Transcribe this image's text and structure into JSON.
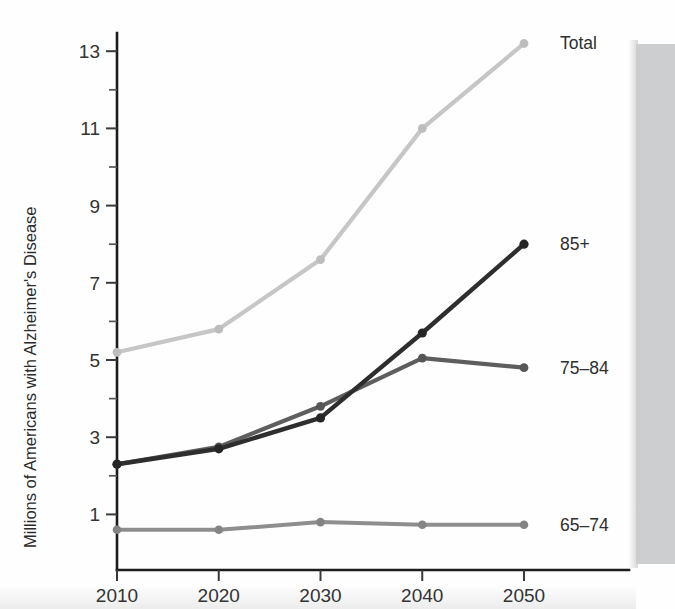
{
  "chart_data": {
    "type": "line",
    "title": "",
    "subtitle": "",
    "xlabel": "",
    "ylabel": "Millions of Americans with Alzheimer's Disease",
    "x": [
      2010,
      2020,
      2030,
      2040,
      2050
    ],
    "xtick_labels": [
      "2010",
      "2020",
      "2030",
      "2040",
      "2050"
    ],
    "ytick_labels": [
      "1",
      "3",
      "5",
      "7",
      "9",
      "11",
      "13"
    ],
    "ytick_values": [
      1,
      3,
      5,
      7,
      9,
      11,
      13
    ],
    "yminor_values": [
      2,
      4,
      6,
      8,
      10,
      12
    ],
    "ylim": [
      0.35,
      13.6
    ],
    "xlim": [
      2010,
      2050
    ],
    "grid": false,
    "legend_position": "right-inline",
    "series": [
      {
        "name": "Total",
        "label": "Total",
        "color": "#c6c6c6",
        "marker_color": "#bdbdbd",
        "stroke_width": 4.2,
        "marker_radius": 4.4,
        "values": [
          5.2,
          5.8,
          7.6,
          11.0,
          13.2
        ]
      },
      {
        "name": "85+",
        "label": "85+",
        "color": "#2e2e2e",
        "marker_color": "#262626",
        "stroke_width": 4.4,
        "marker_radius": 4.6,
        "values": [
          2.3,
          2.7,
          3.5,
          5.7,
          8.0
        ]
      },
      {
        "name": "75-84",
        "label": "75–84",
        "color": "#5e5e5e",
        "marker_color": "#565656",
        "stroke_width": 4.2,
        "marker_radius": 4.4,
        "values": [
          2.3,
          2.75,
          3.8,
          5.05,
          4.8
        ]
      },
      {
        "name": "65-74",
        "label": "65–74",
        "color": "#8e8e8e",
        "marker_color": "#848484",
        "stroke_width": 4.0,
        "marker_radius": 4.3,
        "values": [
          0.6,
          0.6,
          0.8,
          0.73,
          0.73
        ]
      }
    ],
    "annotations": [
      {
        "text": "Total",
        "x": 2050,
        "y": 13.2
      },
      {
        "text": "85+",
        "x": 2050,
        "y": 8.0
      },
      {
        "text": "75–84",
        "x": 2050,
        "y": 4.8
      },
      {
        "text": "65–74",
        "x": 2050,
        "y": 0.73
      }
    ],
    "colors": {
      "axis": "#1c1c1c",
      "text": "#2f2f2f",
      "background": "#ffffff",
      "scan_band": "#c9cacb"
    }
  }
}
